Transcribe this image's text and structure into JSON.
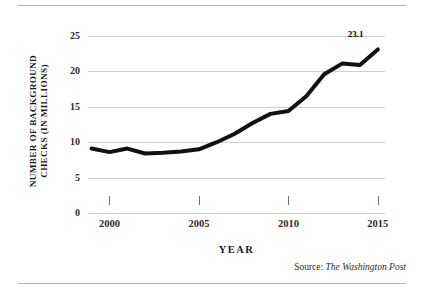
{
  "figure": {
    "has_top_rule": true,
    "has_bottom_rule": true,
    "rule_color": "#b3b3b3",
    "background": "#ffffff"
  },
  "source_note": {
    "prefix": "Source: ",
    "publication": "The Washington Post"
  },
  "chart_data": {
    "type": "line",
    "title": "",
    "subtitle": "",
    "xlabel": "YEAR",
    "ylabel_line1": "NUMBER OF BACKGROUND",
    "ylabel_line2": "CHECKS (IN MILLIONS)",
    "ylabel": "NUMBER OF BACKGROUND CHECKS (IN MILLIONS)",
    "x": [
      1999,
      2000,
      2001,
      2002,
      2003,
      2004,
      2005,
      2006,
      2007,
      2008,
      2009,
      2010,
      2011,
      2012,
      2013,
      2014,
      2015
    ],
    "values": [
      9.1,
      8.6,
      9.1,
      8.4,
      8.5,
      8.7,
      9.0,
      10.0,
      11.2,
      12.7,
      14.0,
      14.4,
      16.5,
      19.6,
      21.1,
      20.9,
      23.1
    ],
    "series": [
      {
        "name": "Number of background checks",
        "color": "#111111",
        "line_width": 4,
        "values": [
          9.1,
          8.6,
          9.1,
          8.4,
          8.5,
          8.7,
          9.0,
          10.0,
          11.2,
          12.7,
          14.0,
          14.4,
          16.5,
          19.6,
          21.1,
          20.9,
          23.1
        ]
      }
    ],
    "annotations": [
      {
        "label": "23.1",
        "x": 2015,
        "y": 23.1
      }
    ],
    "xlim": [
      1998.8,
      1015
    ],
    "x_range": [
      1998.8,
      2015.4
    ],
    "ylim": [
      0,
      25
    ],
    "y_ticks": [
      0,
      5,
      10,
      15,
      20,
      25
    ],
    "y_tick_labels": [
      "0",
      "5",
      "10",
      "15",
      "20",
      "25"
    ],
    "x_ticks": [
      2000,
      2005,
      2010,
      2015
    ],
    "x_tick_labels": [
      "2000",
      "2005",
      "2010",
      "2015"
    ],
    "grid": "horizontal",
    "grid_color": "#cfcfcf",
    "legend": "none",
    "legend_position": "none"
  }
}
